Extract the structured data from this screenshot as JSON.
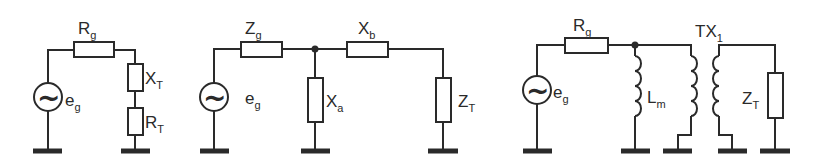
{
  "diagrams": [
    {
      "name": "series-resistive-reactive-load",
      "labels": {
        "source_main": "e",
        "source_sub": "g",
        "rg_main": "R",
        "rg_sub": "g",
        "xt_main": "X",
        "xt_sub": "T",
        "rt_main": "R",
        "rt_sub": "T"
      }
    },
    {
      "name": "l-network-matching",
      "labels": {
        "source_main": "e",
        "source_sub": "g",
        "zg_main": "Z",
        "zg_sub": "g",
        "xb_main": "X",
        "xb_sub": "b",
        "xa_main": "X",
        "xa_sub": "a",
        "zt_main": "Z",
        "zt_sub": "T"
      }
    },
    {
      "name": "transformer-coupled-load",
      "labels": {
        "source_main": "e",
        "source_sub": "g",
        "rg_main": "R",
        "rg_sub": "g",
        "lm_main": "L",
        "lm_sub": "m",
        "tx_main": "TX",
        "tx_sub": "1",
        "zt_main": "Z",
        "zt_sub": "T"
      }
    }
  ],
  "symbols": {
    "ac_source": "~"
  }
}
